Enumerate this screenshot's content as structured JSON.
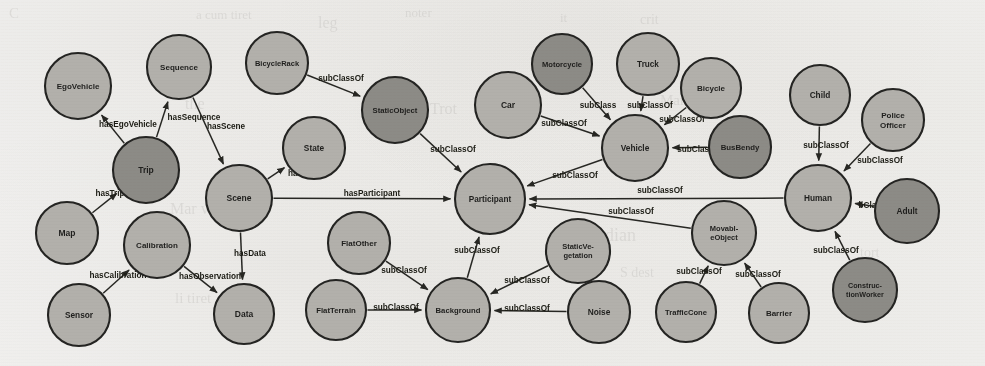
{
  "figure": {
    "kind": "ontology-class-graph",
    "background_color": "#f4f3f1",
    "node_fill_light": "#b4b2ad",
    "node_fill_dark": "#8d8b86",
    "node_stroke": "#20201e",
    "edge_color": "#23231f",
    "text_color": "#1b1b19"
  },
  "bleed_through_text": [
    {
      "text": "C",
      "x": 9,
      "y": 5,
      "size": 15
    },
    {
      "text": "a cum tiret",
      "x": 196,
      "y": 7,
      "size": 13
    },
    {
      "text": "leg",
      "x": 318,
      "y": 14,
      "size": 16
    },
    {
      "text": "noter",
      "x": 405,
      "y": 5,
      "size": 13
    },
    {
      "text": "it",
      "x": 560,
      "y": 10,
      "size": 13
    },
    {
      "text": "crit",
      "x": 640,
      "y": 12,
      "size": 14
    },
    {
      "text": "the",
      "x": 185,
      "y": 95,
      "size": 16
    },
    {
      "text": "Trot",
      "x": 430,
      "y": 100,
      "size": 16
    },
    {
      "text": "Marit",
      "x": 660,
      "y": 92,
      "size": 15
    },
    {
      "text": "Mar ve mir",
      "x": 170,
      "y": 200,
      "size": 16
    },
    {
      "text": "Piordian",
      "x": 575,
      "y": 225,
      "size": 18
    },
    {
      "text": "tort",
      "x": 860,
      "y": 245,
      "size": 14
    },
    {
      "text": "li tiret",
      "x": 175,
      "y": 290,
      "size": 15
    },
    {
      "text": "S dest",
      "x": 620,
      "y": 265,
      "size": 14
    }
  ],
  "nodes": [
    {
      "id": "EgoVehicle",
      "label": [
        "EgoVehicle"
      ],
      "x": 78,
      "y": 86,
      "r": 33,
      "tone": "light",
      "font": 8.0
    },
    {
      "id": "Sequence",
      "label": [
        "Sequence"
      ],
      "x": 179,
      "y": 67,
      "r": 32,
      "tone": "light",
      "font": 8.0
    },
    {
      "id": "Trip",
      "label": [
        "Trip"
      ],
      "x": 146,
      "y": 170,
      "r": 33,
      "tone": "dark",
      "font": 8.5
    },
    {
      "id": "Map",
      "label": [
        "Map"
      ],
      "x": 67,
      "y": 233,
      "r": 31,
      "tone": "light",
      "font": 8.5
    },
    {
      "id": "Scene",
      "label": [
        "Scene"
      ],
      "x": 239,
      "y": 198,
      "r": 33,
      "tone": "light",
      "font": 8.5
    },
    {
      "id": "Calibration",
      "label": [
        "Calibration"
      ],
      "x": 157,
      "y": 245,
      "r": 33,
      "tone": "light",
      "font": 8.0
    },
    {
      "id": "Sensor",
      "label": [
        "Sensor"
      ],
      "x": 79,
      "y": 315,
      "r": 31,
      "tone": "light",
      "font": 8.3
    },
    {
      "id": "Data",
      "label": [
        "Data"
      ],
      "x": 244,
      "y": 314,
      "r": 30,
      "tone": "light",
      "font": 8.5
    },
    {
      "id": "BicycleRack",
      "label": [
        "BicycleRack"
      ],
      "x": 277,
      "y": 63,
      "r": 31,
      "tone": "light",
      "font": 7.5
    },
    {
      "id": "StaticObject",
      "label": [
        "StaticObject"
      ],
      "x": 395,
      "y": 110,
      "r": 33,
      "tone": "dark",
      "font": 7.7
    },
    {
      "id": "State",
      "label": [
        "State"
      ],
      "x": 314,
      "y": 148,
      "r": 31,
      "tone": "light",
      "font": 8.3
    },
    {
      "id": "Car",
      "label": [
        "Car"
      ],
      "x": 508,
      "y": 105,
      "r": 33,
      "tone": "light",
      "font": 8.5
    },
    {
      "id": "Motorcycle",
      "label": [
        "Motorcycle"
      ],
      "x": 562,
      "y": 64,
      "r": 30,
      "tone": "dark",
      "font": 7.6
    },
    {
      "id": "Truck",
      "label": [
        "Truck"
      ],
      "x": 648,
      "y": 64,
      "r": 31,
      "tone": "light",
      "font": 8.2
    },
    {
      "id": "Bicycle",
      "label": [
        "Bicycle"
      ],
      "x": 711,
      "y": 88,
      "r": 30,
      "tone": "light",
      "font": 8.0
    },
    {
      "id": "Vehicle",
      "label": [
        "Vehicle"
      ],
      "x": 635,
      "y": 148,
      "r": 33,
      "tone": "light",
      "font": 8.3
    },
    {
      "id": "BusBendy",
      "label": [
        "BusBendy"
      ],
      "x": 740,
      "y": 147,
      "r": 31,
      "tone": "dark",
      "font": 7.8
    },
    {
      "id": "Participant",
      "label": [
        "Participant"
      ],
      "x": 490,
      "y": 199,
      "r": 35,
      "tone": "light",
      "font": 8.2
    },
    {
      "id": "FlatOther",
      "label": [
        "FlatOther"
      ],
      "x": 359,
      "y": 243,
      "r": 31,
      "tone": "light",
      "font": 8.0
    },
    {
      "id": "FlatTerrain",
      "label": [
        "FlatTerrain"
      ],
      "x": 336,
      "y": 310,
      "r": 30,
      "tone": "light",
      "font": 7.8
    },
    {
      "id": "Background",
      "label": [
        "Background"
      ],
      "x": 458,
      "y": 310,
      "r": 32,
      "tone": "light",
      "font": 7.7
    },
    {
      "id": "StaticVegetation",
      "label": [
        "StaticVe-",
        "getation"
      ],
      "x": 578,
      "y": 251,
      "r": 32,
      "tone": "light",
      "font": 7.5
    },
    {
      "id": "Noise",
      "label": [
        "Noise"
      ],
      "x": 599,
      "y": 312,
      "r": 31,
      "tone": "light",
      "font": 8.3
    },
    {
      "id": "MovableObject",
      "label": [
        "Movabl-",
        "eObject"
      ],
      "x": 724,
      "y": 233,
      "r": 32,
      "tone": "light",
      "font": 7.5
    },
    {
      "id": "TrafficCone",
      "label": [
        "TrafficCone"
      ],
      "x": 686,
      "y": 312,
      "r": 30,
      "tone": "light",
      "font": 7.6
    },
    {
      "id": "Barrier",
      "label": [
        "Barrier"
      ],
      "x": 779,
      "y": 313,
      "r": 30,
      "tone": "light",
      "font": 8.0
    },
    {
      "id": "Human",
      "label": [
        "Human"
      ],
      "x": 818,
      "y": 198,
      "r": 33,
      "tone": "light",
      "font": 8.3
    },
    {
      "id": "Child",
      "label": [
        "Child"
      ],
      "x": 820,
      "y": 95,
      "r": 30,
      "tone": "light",
      "font": 8.3
    },
    {
      "id": "PoliceOfficer",
      "label": [
        "Police",
        "Officer"
      ],
      "x": 893,
      "y": 120,
      "r": 31,
      "tone": "light",
      "font": 8.0
    },
    {
      "id": "Adult",
      "label": [
        "Adult"
      ],
      "x": 907,
      "y": 211,
      "r": 32,
      "tone": "dark",
      "font": 8.3
    },
    {
      "id": "ConstructionWorker",
      "label": [
        "Construc-",
        "tionWorker"
      ],
      "x": 865,
      "y": 290,
      "r": 32,
      "tone": "dark",
      "font": 7.2
    }
  ],
  "edges": [
    {
      "from": "Trip",
      "to": "EgoVehicle",
      "label": "hasEgoVehicle",
      "lx": 128,
      "ly": 127
    },
    {
      "from": "Trip",
      "to": "Sequence",
      "label": "hasSequence",
      "lx": 194,
      "ly": 120
    },
    {
      "from": "Sequence",
      "to": "Scene",
      "label": "hasScene",
      "lx": 226,
      "ly": 129
    },
    {
      "from": "Map",
      "to": "Trip",
      "label": "hasTrip",
      "lx": 110,
      "ly": 196
    },
    {
      "from": "Sensor",
      "to": "Calibration",
      "label": "hasCalibration",
      "lx": 118,
      "ly": 278
    },
    {
      "from": "Calibration",
      "to": "Data",
      "label": "hasObservation",
      "lx": 210,
      "ly": 279
    },
    {
      "from": "Scene",
      "to": "Data",
      "label": "hasData",
      "lx": 250,
      "ly": 256
    },
    {
      "from": "Scene",
      "to": "State",
      "label": "hasState",
      "lx": 305,
      "ly": 176
    },
    {
      "from": "Scene",
      "to": "Participant",
      "label": "hasParticipant",
      "lx": 372,
      "ly": 196
    },
    {
      "from": "BicycleRack",
      "to": "StaticObject",
      "label": "subClassOf",
      "lx": 341,
      "ly": 81
    },
    {
      "from": "StaticObject",
      "to": "Participant",
      "label": "subClassOf",
      "lx": 453,
      "ly": 152
    },
    {
      "from": "Car",
      "to": "Vehicle",
      "label": "subClassOf",
      "lx": 564,
      "ly": 126
    },
    {
      "from": "Motorcycle",
      "to": "Vehicle",
      "label": "subClass",
      "lx": 598,
      "ly": 108
    },
    {
      "from": "Truck",
      "to": "Vehicle",
      "label": "subClassOf",
      "lx": 650,
      "ly": 108
    },
    {
      "from": "Bicycle",
      "to": "Vehicle",
      "label": "subClassOf",
      "lx": 682,
      "ly": 122
    },
    {
      "from": "BusBendy",
      "to": "Vehicle",
      "label": "subClassOf",
      "lx": 700,
      "ly": 152
    },
    {
      "from": "Vehicle",
      "to": "Participant",
      "label": "subClassOf",
      "lx": 575,
      "ly": 178
    },
    {
      "from": "Human",
      "to": "Participant",
      "label": "subClassOf",
      "lx": 660,
      "ly": 193
    },
    {
      "from": "MovableObject",
      "to": "Participant",
      "label": "subClassOf",
      "lx": 631,
      "ly": 214
    },
    {
      "from": "StaticVegetation",
      "to": "Background",
      "label": "subClassOf",
      "lx": 527,
      "ly": 283
    },
    {
      "from": "FlatOther",
      "to": "Background",
      "label": "subClassOf",
      "lx": 404,
      "ly": 273
    },
    {
      "from": "FlatTerrain",
      "to": "Background",
      "label": "subClassOf",
      "lx": 396,
      "ly": 310
    },
    {
      "from": "Noise",
      "to": "Background",
      "label": "subClassOf",
      "lx": 527,
      "ly": 311
    },
    {
      "from": "Background",
      "to": "Participant",
      "label": "subClassOf",
      "lx": 477,
      "ly": 253
    },
    {
      "from": "TrafficCone",
      "to": "MovableObject",
      "label": "subClassOf",
      "lx": 699,
      "ly": 274
    },
    {
      "from": "Barrier",
      "to": "MovableObject",
      "label": "subClassOf",
      "lx": 758,
      "ly": 277
    },
    {
      "from": "Child",
      "to": "Human",
      "label": "subClassOf",
      "lx": 826,
      "ly": 148
    },
    {
      "from": "PoliceOfficer",
      "to": "Human",
      "label": "subClassOf",
      "lx": 880,
      "ly": 163
    },
    {
      "from": "Adult",
      "to": "Human",
      "label": "bClass",
      "lx": 872,
      "ly": 208
    },
    {
      "from": "ConstructionWorker",
      "to": "Human",
      "label": "subClassOf",
      "lx": 836,
      "ly": 253
    }
  ]
}
